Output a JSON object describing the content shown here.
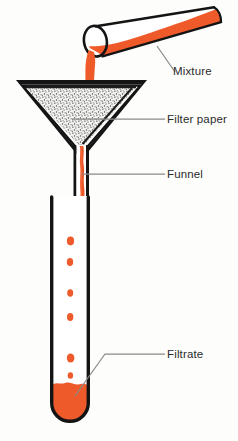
{
  "figure": {
    "background_color": "#fdfdfb",
    "labels": [
      {
        "id": "mixture",
        "text": "Mixture",
        "leader": "diagonal-down-left"
      },
      {
        "id": "filter_paper",
        "text": "Filter paper",
        "leader": "horizontal-left"
      },
      {
        "id": "funnel",
        "text": "Funnel",
        "leader": "horizontal-left"
      },
      {
        "id": "filtrate",
        "text": "Filtrate",
        "leader": "horizontal-then-diagonal-down-left"
      }
    ],
    "colors": {
      "liquid": "#ef5a2b",
      "liquid_shade": "#e04a1d",
      "outline": "#141414",
      "leader_line": "#8a8a8a",
      "text": "#2b2b2b",
      "stipple": "#3a3a3a",
      "paper_fill": "#f2f2f0",
      "glass_fill": "#ffffff"
    },
    "parts": {
      "test_tube_pouring": {
        "name": "Mixture container (tilted test tube)",
        "contents": "Mixture",
        "contents_color": "#ef5a2b"
      },
      "funnel": {
        "name": "Funnel",
        "contains": "Filter paper cone"
      },
      "filter_paper": {
        "name": "Filter paper",
        "texture": "stippled"
      },
      "receiving_tube": {
        "name": "Receiving test tube",
        "contents": "Filtrate",
        "contents_color": "#ef5a2b",
        "droplet_count": 6
      },
      "pour_stream": {
        "name": "Pouring stream",
        "color": "#ef5a2b"
      }
    }
  }
}
